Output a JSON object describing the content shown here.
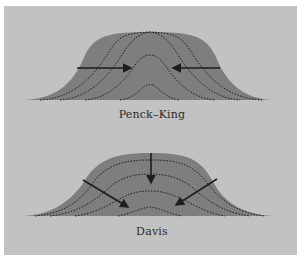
{
  "diagram": {
    "background_color": "#c2c2c2",
    "mountain_color": "#7e7e7e",
    "line_color": "#1e1e1e",
    "panels": [
      {
        "id": "penck-king",
        "caption": "Penck–King",
        "arrows": [
          {
            "direction": "right",
            "meaning": "parallel slope retreat from left"
          },
          {
            "direction": "left",
            "meaning": "parallel slope retreat from right"
          }
        ],
        "successive_profiles": 3
      },
      {
        "id": "davis",
        "caption": "Davis",
        "arrows": [
          {
            "direction": "down",
            "meaning": "downwearing from summit"
          },
          {
            "direction": "down-right",
            "meaning": "slope decline from left"
          },
          {
            "direction": "down-left",
            "meaning": "slope decline from right"
          }
        ],
        "successive_profiles": 4
      }
    ]
  }
}
